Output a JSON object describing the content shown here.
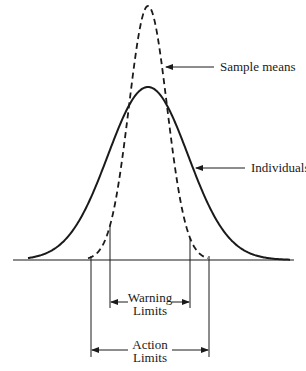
{
  "diagram": {
    "title": "",
    "type": "normal-distribution-comparison",
    "colors": {
      "line": "#1a1a1a",
      "background": "#ffffff"
    },
    "curves": [
      {
        "name": "individuals",
        "label": "Individuals",
        "style": "solid",
        "mean_x": 148,
        "sigma_px": 40,
        "peak_y": 87
      },
      {
        "name": "sample-means",
        "label": "Sample means",
        "style": "dashed",
        "mean_x": 148,
        "sigma_px": 19,
        "peak_y": 6
      }
    ],
    "baseline": {
      "y": 260,
      "x_start": 13,
      "x_end": 294
    },
    "annotations": {
      "sample_means": {
        "text": "Sample means",
        "arrow_from": [
          214,
          67
        ],
        "arrow_to": [
          166,
          67
        ],
        "label_x": 220,
        "label_y": 60
      },
      "individuals": {
        "text": "Individuals",
        "arrow_from": [
          245,
          168
        ],
        "arrow_to": [
          196,
          168
        ],
        "label_x": 251,
        "label_y": 161
      }
    },
    "limits": {
      "warning": {
        "line1": "Warning",
        "line2": "Limits",
        "sigma_multiple": 2,
        "left_x": 110,
        "right_x": 190,
        "line_bottom_y": 308,
        "arrow_y": 302,
        "text_y1": 291,
        "text_y2": 304
      },
      "action": {
        "line1": "Action",
        "line2": "Limits",
        "sigma_multiple": 3,
        "left_x": 91,
        "right_x": 209,
        "line_bottom_y": 357,
        "arrow_y": 350,
        "text_y1": 338,
        "text_y2": 351
      }
    }
  }
}
